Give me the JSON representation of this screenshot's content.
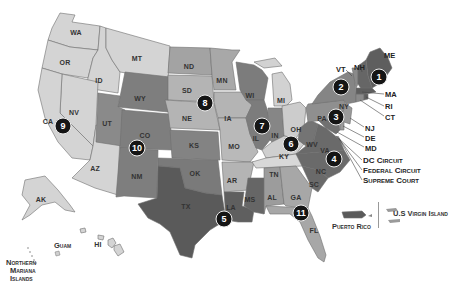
{
  "map": {
    "title": "U.S. Federal Judicial Circuits",
    "colors": {
      "circuit_1": "#5e5e5e",
      "circuit_2": "#858585",
      "circuit_3": "#8f8f8f",
      "circuit_4": "#6a6a6a",
      "circuit_5": "#5a5a5a",
      "circuit_6": "#c8c8c8",
      "circuit_7": "#7c7c7c",
      "circuit_8": "#b4b4b4",
      "circuit_9": "#d4d4d4",
      "circuit_10": "#7e7e7e",
      "circuit_11": "#a7a7a7",
      "background": "#ffffff",
      "pin": "#151515"
    },
    "states": [
      {
        "abbr": "WA",
        "circuit": 9
      },
      {
        "abbr": "OR",
        "circuit": 9
      },
      {
        "abbr": "ID",
        "circuit": 9
      },
      {
        "abbr": "MT",
        "circuit": 9
      },
      {
        "abbr": "NV",
        "circuit": 9
      },
      {
        "abbr": "CA",
        "circuit": 9
      },
      {
        "abbr": "AZ",
        "circuit": 9
      },
      {
        "abbr": "AK",
        "circuit": 9
      },
      {
        "abbr": "HI",
        "circuit": 9
      },
      {
        "abbr": "WY",
        "circuit": 10
      },
      {
        "abbr": "UT",
        "circuit": 10
      },
      {
        "abbr": "CO",
        "circuit": 10
      },
      {
        "abbr": "NM",
        "circuit": 10
      },
      {
        "abbr": "KS",
        "circuit": 10
      },
      {
        "abbr": "OK",
        "circuit": 10
      },
      {
        "abbr": "ND",
        "circuit": 8
      },
      {
        "abbr": "SD",
        "circuit": 8
      },
      {
        "abbr": "NE",
        "circuit": 8
      },
      {
        "abbr": "MN",
        "circuit": 8
      },
      {
        "abbr": "IA",
        "circuit": 8
      },
      {
        "abbr": "MO",
        "circuit": 8
      },
      {
        "abbr": "AR",
        "circuit": 8
      },
      {
        "abbr": "TX",
        "circuit": 5
      },
      {
        "abbr": "LA",
        "circuit": 5
      },
      {
        "abbr": "MS",
        "circuit": 5
      },
      {
        "abbr": "WI",
        "circuit": 7
      },
      {
        "abbr": "IL",
        "circuit": 7
      },
      {
        "abbr": "IN",
        "circuit": 7
      },
      {
        "abbr": "MI",
        "circuit": 6
      },
      {
        "abbr": "OH",
        "circuit": 6
      },
      {
        "abbr": "KY",
        "circuit": 6
      },
      {
        "abbr": "TN",
        "circuit": 6
      },
      {
        "abbr": "AL",
        "circuit": 11
      },
      {
        "abbr": "GA",
        "circuit": 11
      },
      {
        "abbr": "FL",
        "circuit": 11
      },
      {
        "abbr": "WV",
        "circuit": 4
      },
      {
        "abbr": "VA",
        "circuit": 4
      },
      {
        "abbr": "NC",
        "circuit": 4
      },
      {
        "abbr": "SC",
        "circuit": 4
      },
      {
        "abbr": "MD",
        "circuit": 4
      },
      {
        "abbr": "PA",
        "circuit": 3
      },
      {
        "abbr": "NJ",
        "circuit": 3
      },
      {
        "abbr": "DE",
        "circuit": 3
      },
      {
        "abbr": "NY",
        "circuit": 2
      },
      {
        "abbr": "VT",
        "circuit": 2
      },
      {
        "abbr": "CT",
        "circuit": 2
      },
      {
        "abbr": "ME",
        "circuit": 1
      },
      {
        "abbr": "NH",
        "circuit": 1
      },
      {
        "abbr": "MA",
        "circuit": 1
      },
      {
        "abbr": "RI",
        "circuit": 1
      }
    ],
    "labels": {
      "WA": "WA",
      "OR": "OR",
      "ID": "ID",
      "MT": "MT",
      "NV": "NV",
      "CA": "CA",
      "AZ": "AZ",
      "WY": "WY",
      "UT": "UT",
      "CO": "CO",
      "NM": "NM",
      "KS": "KS",
      "OK": "OK",
      "ND": "ND",
      "SD": "SD",
      "NE": "NE",
      "MN": "MN",
      "IA": "IA",
      "MO": "MO",
      "AR": "AR",
      "TX": "TX",
      "LA": "LA",
      "MS": "MS",
      "WI": "WI",
      "IL": "IL",
      "IN": "IN",
      "MI": "MI",
      "OH": "OH",
      "KY": "KY",
      "TN": "TN",
      "AL": "AL",
      "GA": "GA",
      "FL": "FL",
      "WV": "WV",
      "VA": "VA",
      "NC": "NC",
      "SC": "SC",
      "PA": "PA",
      "NY": "NY",
      "AK": "AK",
      "HI": "HI"
    },
    "callouts": {
      "ME": "ME",
      "VT": "VT",
      "NH": "NH",
      "MA": "MA",
      "RI": "RI",
      "CT": "CT",
      "NJ": "NJ",
      "DE": "DE",
      "MD": "MD",
      "dc_circuit": "DC Circuit",
      "federal_circuit": "Federal Circuit",
      "supreme_court": "Supreme Court"
    },
    "circuit_pins": [
      {
        "number": "1",
        "x": 379,
        "y": 77
      },
      {
        "number": "2",
        "x": 341,
        "y": 87
      },
      {
        "number": "3",
        "x": 336,
        "y": 117
      },
      {
        "number": "4",
        "x": 334,
        "y": 159
      },
      {
        "number": "5",
        "x": 224,
        "y": 219
      },
      {
        "number": "6",
        "x": 291,
        "y": 144
      },
      {
        "number": "7",
        "x": 262,
        "y": 126
      },
      {
        "number": "8",
        "x": 205,
        "y": 103
      },
      {
        "number": "9",
        "x": 63,
        "y": 126
      },
      {
        "number": "10",
        "x": 137,
        "y": 148
      },
      {
        "number": "11",
        "x": 301,
        "y": 213
      }
    ],
    "territories": {
      "guam": "Guam",
      "northern_mariana_1": "Northern",
      "northern_mariana_2": "Mariana",
      "northern_mariana_3": "Islands",
      "puerto_rico": "Puerto Rico",
      "us_virgin_island": "U.S Virgin Island"
    }
  }
}
